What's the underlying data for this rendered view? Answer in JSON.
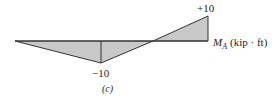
{
  "diagram": {
    "type": "influence-line",
    "caption": "(c)",
    "axis_label": {
      "symbol": "M",
      "subscript": "A",
      "units": "(kip · ft)"
    },
    "labels": {
      "min_value": "−10",
      "max_value": "+10"
    },
    "points": [
      {
        "x": 15,
        "y": 41,
        "value": 0
      },
      {
        "x": 101,
        "y": 63,
        "value": -10
      },
      {
        "x": 153,
        "y": 41,
        "value": 0
      },
      {
        "x": 208,
        "y": 16,
        "value": 10
      },
      {
        "x": 208,
        "y": 41,
        "value": 0
      }
    ],
    "colors": {
      "fill": "#c8c8c8",
      "line": "#333333",
      "text": "#222222"
    }
  }
}
